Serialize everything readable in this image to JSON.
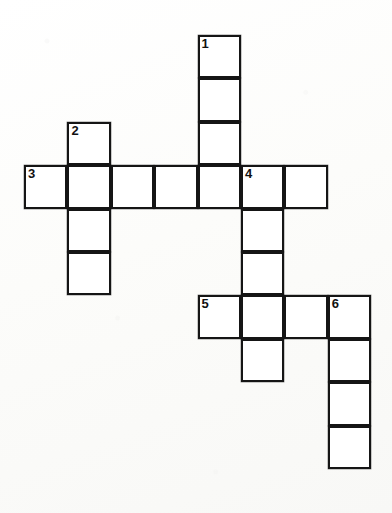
{
  "puzzle": {
    "type": "crossword-grid",
    "title": "Crossword puzzle grid",
    "geometry": {
      "cell_size": 43.4,
      "origin_x": 24,
      "origin_y": 35,
      "columns": 8,
      "rows": 11,
      "line_color": "#151515",
      "cell_fill": "#ffffff",
      "background": "#fdfdfc"
    },
    "entries": [
      {
        "number": "1",
        "direction": "down",
        "row": 0,
        "col": 4,
        "length": 4
      },
      {
        "number": "2",
        "direction": "down",
        "row": 2,
        "col": 1,
        "length": 4
      },
      {
        "number": "3",
        "direction": "across",
        "row": 3,
        "col": 0,
        "length": 7
      },
      {
        "number": "4",
        "direction": "down",
        "row": 3,
        "col": 5,
        "length": 5
      },
      {
        "number": "5",
        "direction": "across",
        "row": 6,
        "col": 4,
        "length": 4
      },
      {
        "number": "6",
        "direction": "down",
        "row": 6,
        "col": 7,
        "length": 4
      }
    ],
    "cells": [
      {
        "row": 0,
        "col": 4,
        "number": "1",
        "letter": ""
      },
      {
        "row": 1,
        "col": 4,
        "number": "",
        "letter": ""
      },
      {
        "row": 2,
        "col": 4,
        "number": "",
        "letter": ""
      },
      {
        "row": 2,
        "col": 1,
        "number": "2",
        "letter": ""
      },
      {
        "row": 3,
        "col": 0,
        "number": "3",
        "letter": ""
      },
      {
        "row": 3,
        "col": 1,
        "number": "",
        "letter": ""
      },
      {
        "row": 3,
        "col": 2,
        "number": "",
        "letter": ""
      },
      {
        "row": 3,
        "col": 3,
        "number": "",
        "letter": ""
      },
      {
        "row": 3,
        "col": 4,
        "number": "",
        "letter": ""
      },
      {
        "row": 3,
        "col": 5,
        "number": "4",
        "letter": ""
      },
      {
        "row": 3,
        "col": 6,
        "number": "",
        "letter": ""
      },
      {
        "row": 4,
        "col": 1,
        "number": "",
        "letter": ""
      },
      {
        "row": 5,
        "col": 1,
        "number": "",
        "letter": ""
      },
      {
        "row": 4,
        "col": 5,
        "number": "",
        "letter": ""
      },
      {
        "row": 5,
        "col": 5,
        "number": "",
        "letter": ""
      },
      {
        "row": 6,
        "col": 4,
        "number": "5",
        "letter": ""
      },
      {
        "row": 6,
        "col": 5,
        "number": "",
        "letter": ""
      },
      {
        "row": 6,
        "col": 6,
        "number": "",
        "letter": ""
      },
      {
        "row": 6,
        "col": 7,
        "number": "6",
        "letter": ""
      },
      {
        "row": 7,
        "col": 5,
        "number": "",
        "letter": ""
      },
      {
        "row": 7,
        "col": 7,
        "number": "",
        "letter": ""
      },
      {
        "row": 8,
        "col": 7,
        "number": "",
        "letter": ""
      },
      {
        "row": 9,
        "col": 7,
        "number": "",
        "letter": ""
      }
    ]
  }
}
